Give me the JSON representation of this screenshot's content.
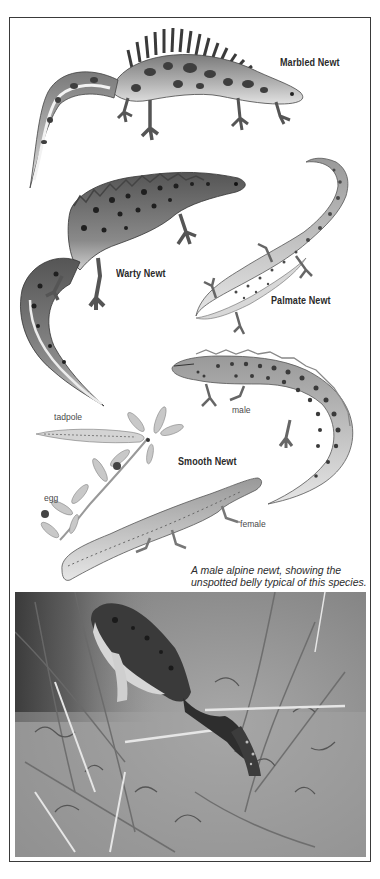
{
  "page": {
    "frame_color": "#3a3a3a",
    "background": "#ffffff"
  },
  "illustrations": [
    {
      "id": "marbled-newt",
      "label": "Marbled Newt"
    },
    {
      "id": "warty-newt",
      "label": "Warty Newt"
    },
    {
      "id": "palmate-newt",
      "label": "Palmate Newt"
    },
    {
      "id": "smooth-newt",
      "label": "Smooth Newt",
      "sub_labels": {
        "male": "male",
        "female": "female",
        "tadpole": "tadpole",
        "egg": "egg"
      }
    }
  ],
  "caption": {
    "line1": "A male alpine newt, showing the",
    "line2": "unspotted belly typical of this species."
  },
  "photo": {
    "subject": "male alpine newt on water weed",
    "tone": "grayscale"
  }
}
